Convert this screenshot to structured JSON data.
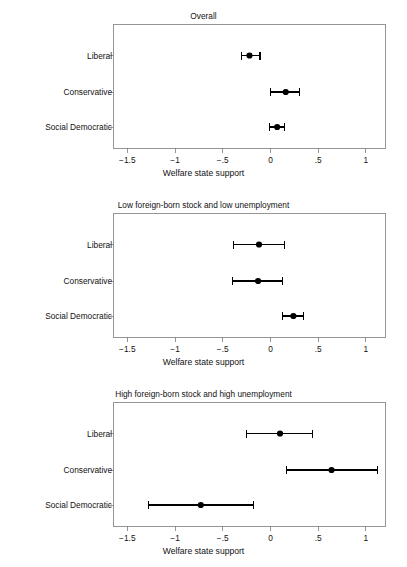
{
  "figure": {
    "background_color": "#ffffff",
    "line_color": "#000000",
    "frame_color": "#7a7a7a",
    "marker_color": "#000000"
  },
  "axis": {
    "xlabel": "Welfare state support",
    "xlim": [
      -1.65,
      1.2
    ],
    "tick_values": [
      -1.5,
      -1,
      -0.5,
      0,
      0.5,
      1
    ],
    "tick_labels": [
      "−1.5",
      "−1",
      "−.5",
      "0",
      ".5",
      "1"
    ]
  },
  "categories": [
    "Liberal",
    "Conservative",
    "Social Democratic"
  ],
  "panels": [
    {
      "title": "Overall",
      "categories": [
        "Liberal",
        "Conservative",
        "Social Democratic"
      ],
      "estimates": [
        -0.22,
        0.16,
        0.07
      ],
      "ci_low": [
        -0.3,
        0.0,
        -0.01
      ],
      "ci_high": [
        -0.11,
        0.3,
        0.15
      ]
    },
    {
      "title": "Low foreign-born stock and low unemployment",
      "categories": [
        "Liberal",
        "Conservative",
        "Social Democratic"
      ],
      "estimates": [
        -0.12,
        -0.13,
        0.24
      ],
      "ci_low": [
        -0.39,
        -0.4,
        0.13
      ],
      "ci_high": [
        0.15,
        0.13,
        0.35
      ]
    },
    {
      "title": "High foreign-born stock and high unemployment",
      "categories": [
        "Liberal",
        "Conservative",
        "Social Democratic"
      ],
      "estimates": [
        0.1,
        0.64,
        -0.73
      ],
      "ci_low": [
        -0.25,
        0.17,
        -1.28
      ],
      "ci_high": [
        0.44,
        1.12,
        -0.18
      ]
    }
  ],
  "chart_data": {
    "type": "scatter",
    "xlabel": "Welfare state support",
    "ylabel": "",
    "xlim": [
      -1.65,
      1.2
    ],
    "xticks": [
      -1.5,
      -1,
      -0.5,
      0,
      0.5,
      1
    ],
    "xticklabels": [
      "−1.5",
      "−1",
      "−.5",
      "0",
      ".5",
      "1"
    ],
    "grid": false,
    "legend": "none",
    "orientation": "horizontal",
    "error_bars": "95% confidence interval",
    "categories": [
      "Liberal",
      "Conservative",
      "Social Democratic"
    ],
    "panels": [
      {
        "title": "Overall",
        "points": [
          {
            "category": "Liberal",
            "estimate": -0.22,
            "ci_low": -0.3,
            "ci_high": -0.11
          },
          {
            "category": "Conservative",
            "estimate": 0.16,
            "ci_low": 0.0,
            "ci_high": 0.3
          },
          {
            "category": "Social Democratic",
            "estimate": 0.07,
            "ci_low": -0.01,
            "ci_high": 0.15
          }
        ]
      },
      {
        "title": "Low foreign-born stock and low unemployment",
        "points": [
          {
            "category": "Liberal",
            "estimate": -0.12,
            "ci_low": -0.39,
            "ci_high": 0.15
          },
          {
            "category": "Conservative",
            "estimate": -0.13,
            "ci_low": -0.4,
            "ci_high": 0.13
          },
          {
            "category": "Social Democratic",
            "estimate": 0.24,
            "ci_low": 0.13,
            "ci_high": 0.35
          }
        ]
      },
      {
        "title": "High foreign-born stock and high unemployment",
        "points": [
          {
            "category": "Liberal",
            "estimate": 0.1,
            "ci_low": -0.25,
            "ci_high": 0.44
          },
          {
            "category": "Conservative",
            "estimate": 0.64,
            "ci_low": 0.17,
            "ci_high": 1.12
          },
          {
            "category": "Social Democratic",
            "estimate": -0.73,
            "ci_low": -1.28,
            "ci_high": -0.18
          }
        ]
      }
    ]
  }
}
